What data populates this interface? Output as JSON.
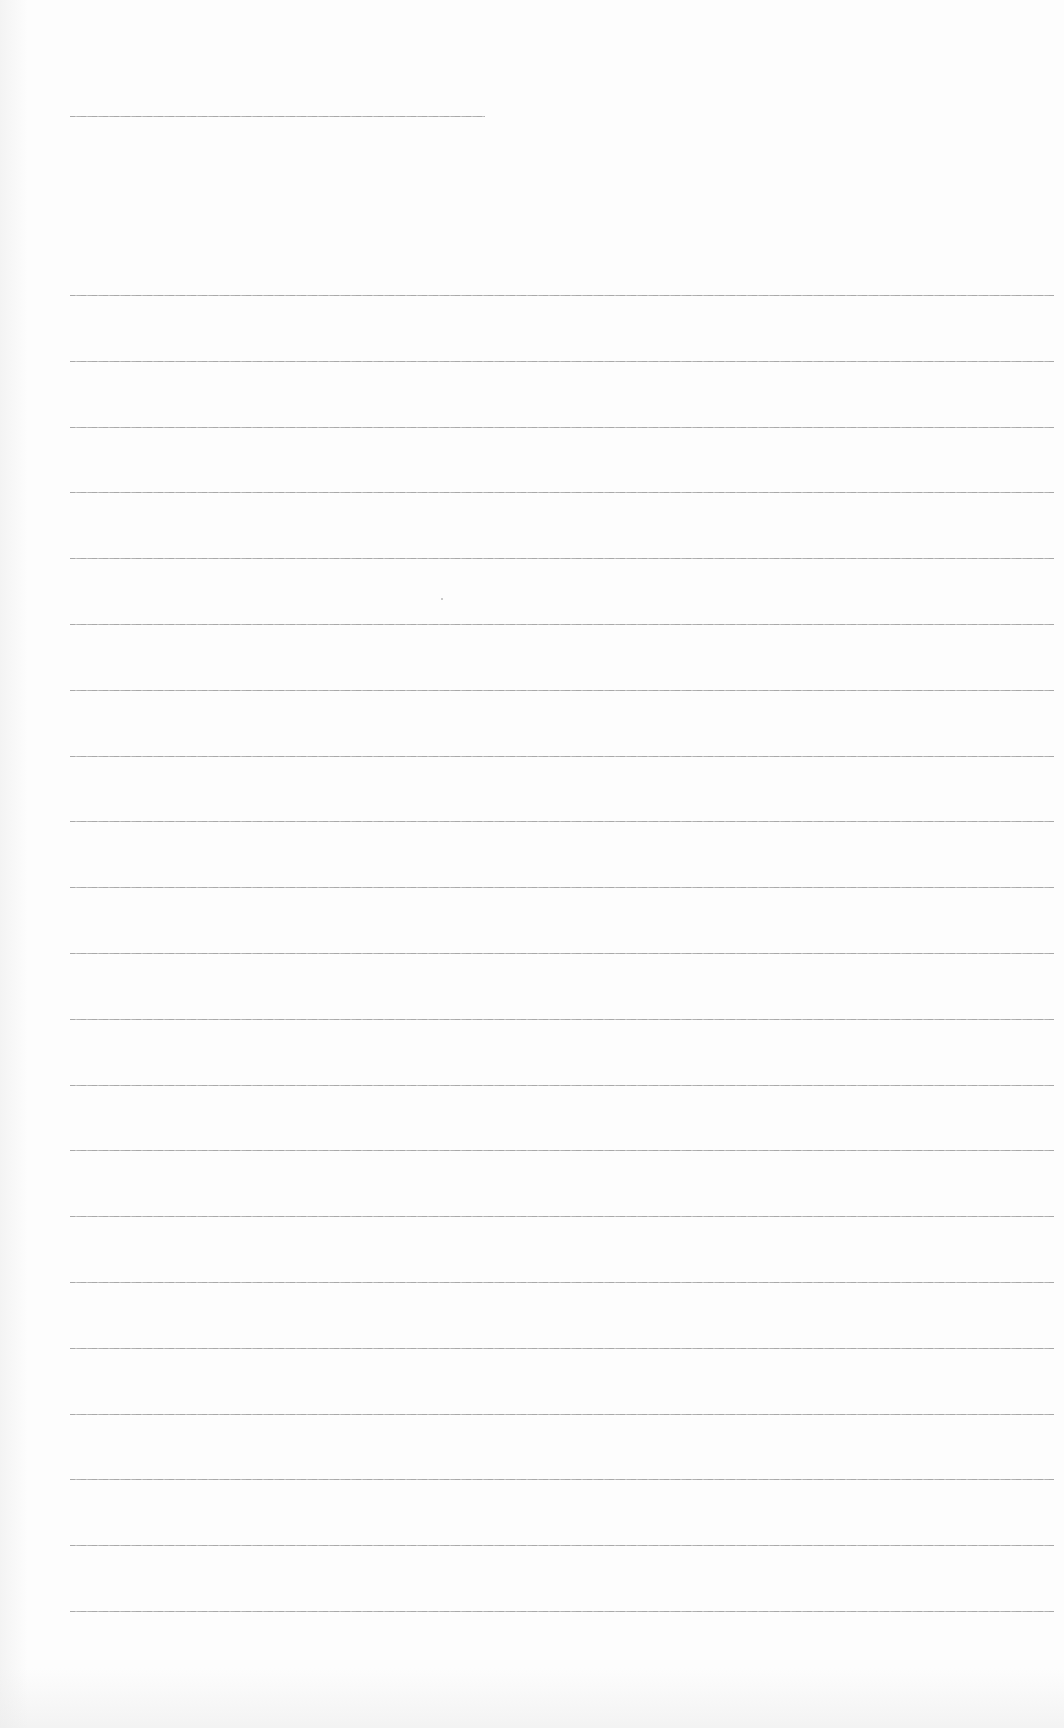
{
  "document": {
    "type": "lined-paper",
    "header_line": {
      "x": 70,
      "y": 116,
      "width": 415
    },
    "ruled_lines": {
      "count": 21,
      "x": 70,
      "width": 984,
      "first_y": 295,
      "spacing": 65.8
    },
    "line_color": "#9a9a9a",
    "background_color": "#fdfdfd"
  }
}
